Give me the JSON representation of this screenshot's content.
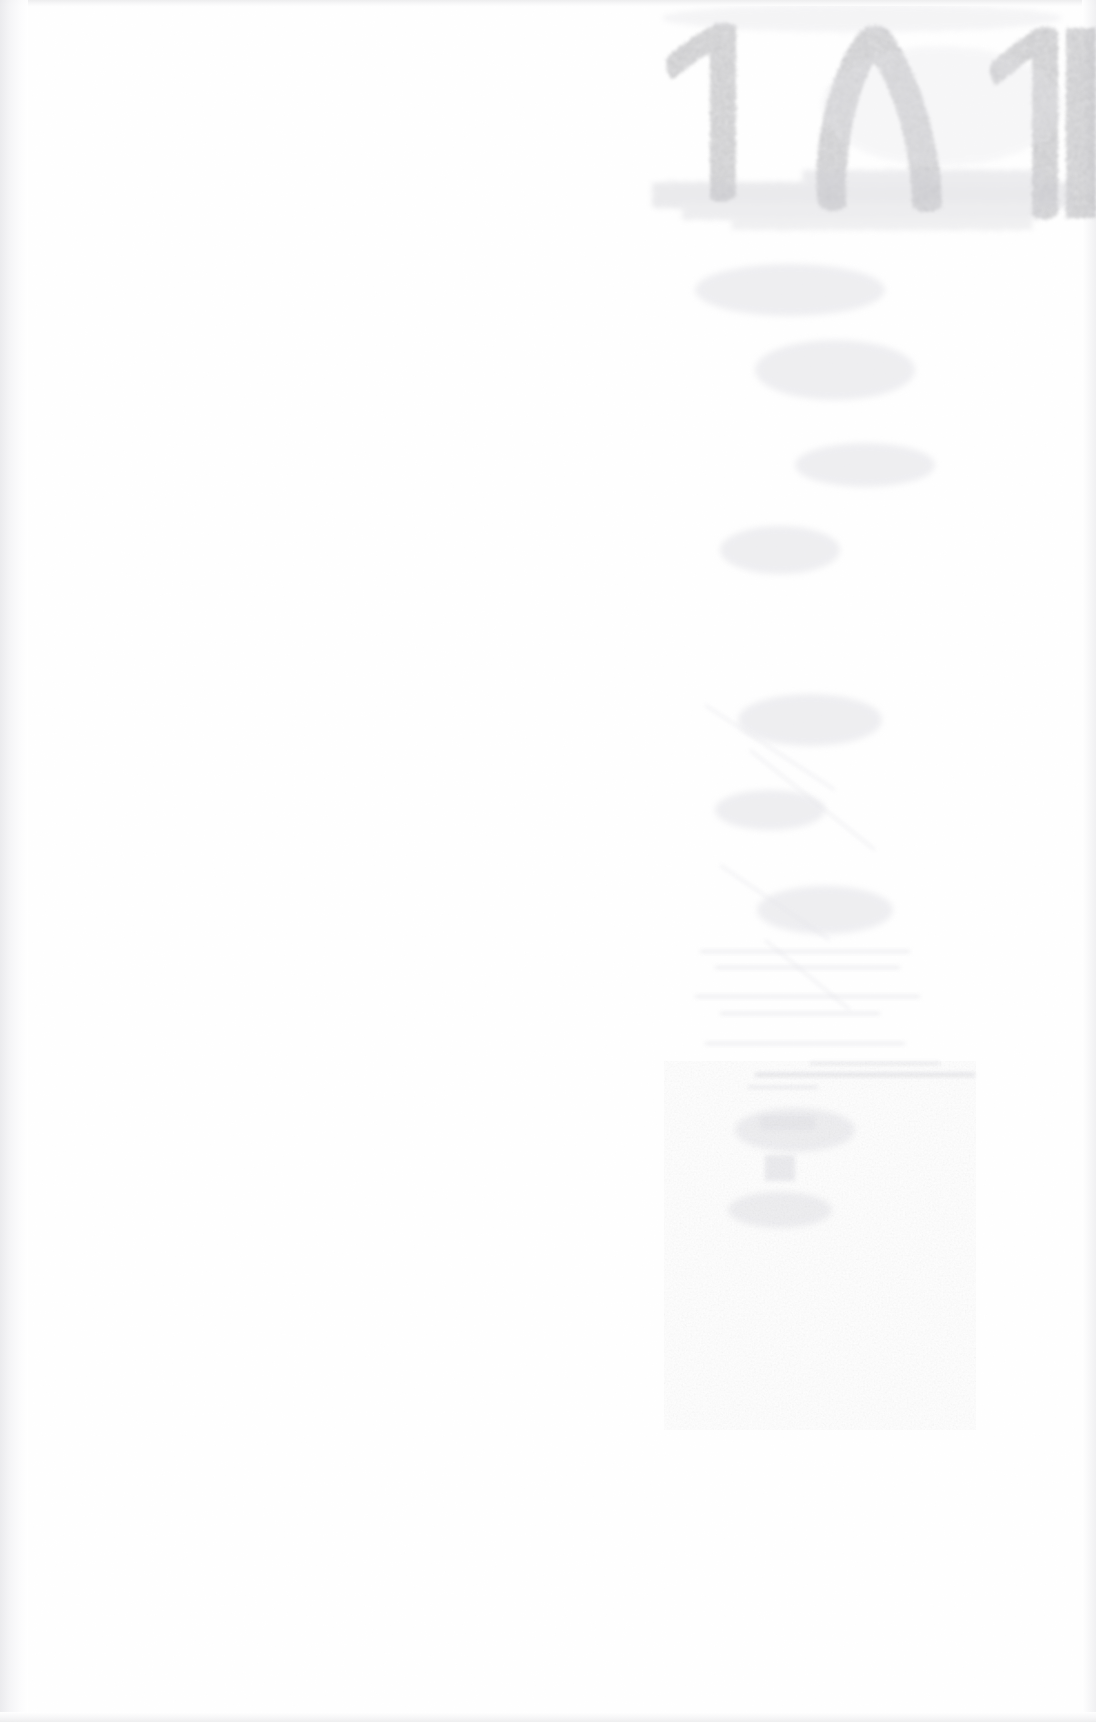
{
  "document": {
    "kind": "scanned-page",
    "page_state": "blank",
    "width": 1096,
    "height": 1722,
    "background_color": "#ffffff",
    "description": "Blank scanned book page with faint ink show-through from the reverse side"
  },
  "marks": {
    "bleed_numeral": {
      "name": "page-number-bleed-through",
      "text": "۱۸۱",
      "reading": "181",
      "script": "persian-arabic-indic-digits",
      "orientation": "show-through / mirrored from verso",
      "color": "#b9b9bd",
      "position": "top-right",
      "glyphs": [
        "۱",
        "۸",
        "۱"
      ]
    },
    "smear_band": {
      "name": "horizontal-ink-smear",
      "color": "#cfcfd4",
      "position": "below numerals, top-right"
    },
    "showthrough_lines": {
      "name": "faint-text-line-traces",
      "color": "#e4e4e8",
      "position": "right-center column",
      "legible": false
    }
  },
  "edges": {
    "top_band_color": "#ececed",
    "left_band_color": "#e9e9ec",
    "right_band_color": "#efeff1",
    "bottom_band_color": "#ededee"
  }
}
